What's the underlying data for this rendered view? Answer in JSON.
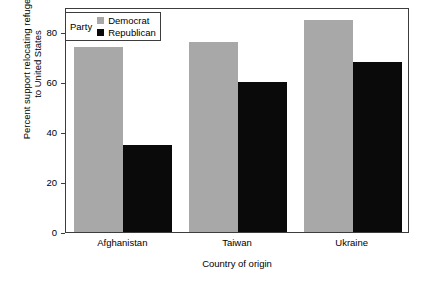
{
  "chart_data": {
    "type": "bar",
    "title": "",
    "subtitle": "",
    "categories": [
      "Afghanistan",
      "Taiwan",
      "Ukraine"
    ],
    "series": [
      {
        "name": "Democrat",
        "color": "#a8a8a8",
        "values": [
          74,
          76,
          85
        ]
      },
      {
        "name": "Republican",
        "color": "#0a0a0a",
        "values": [
          35,
          60,
          68
        ]
      }
    ],
    "xlabel": "Country of origin",
    "ylabel": "Percent support relocating refugees to United States",
    "ylabel_lines": [
      "Percent support relocating refugees",
      "to United States"
    ],
    "ylim": [
      0,
      90
    ],
    "yticks": [
      0,
      20,
      40,
      60,
      80
    ],
    "ytick_labels": [
      "0",
      "20",
      "40",
      "60",
      "80"
    ],
    "grid": false,
    "legend": {
      "title": "Party",
      "position": "top-left-inside",
      "entries": [
        {
          "label": "Democrat",
          "color": "#a8a8a8"
        },
        {
          "label": "Republican",
          "color": "#0a0a0a"
        }
      ]
    },
    "frame": true,
    "bar_grouping": "grouped"
  }
}
